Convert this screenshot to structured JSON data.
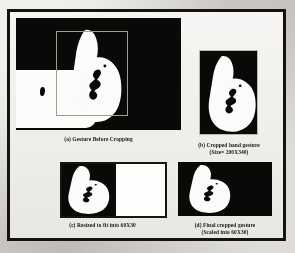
{
  "figure": {
    "background_color": "#d9d7d3",
    "frame_color": "#15130f",
    "panel_background": "#0a0908",
    "foreground_color": "#fbfbf9",
    "crop_rect_color": "#9d9c98"
  },
  "panels": [
    {
      "id": "a",
      "caption_line1": "(a) Gesture Before Cropping",
      "caption_line2": "",
      "image": "binary-thumbs-up-gesture-with-crop-rectangle",
      "background": "black",
      "has_crop_rectangle": true
    },
    {
      "id": "b",
      "caption_line1": "(b) Cropped hand gesture",
      "caption_line2": "(Size= 200X340)",
      "image": "binary-thumbs-up-gesture-cropped",
      "background": "black",
      "has_crop_rectangle": false
    },
    {
      "id": "c",
      "caption_line1": "(c) Resized to fit into 60X30",
      "caption_line2": "",
      "image": "binary-thumbs-up-gesture-resized-left-aligned",
      "background": "white",
      "has_crop_rectangle": false
    },
    {
      "id": "d",
      "caption_line1": "(d) Final cropped gesture",
      "caption_line2": "(Scaled into 60X30)",
      "image": "binary-thumbs-up-gesture-final",
      "background": "black",
      "has_crop_rectangle": false
    }
  ]
}
